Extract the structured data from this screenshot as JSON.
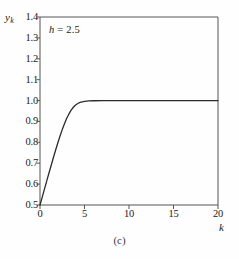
{
  "figure": {
    "caption": "(c)",
    "annotation_variable": "h",
    "annotation_text": "= 2.5",
    "background_color": "#fefefe",
    "line_color": "#2b2b2b",
    "axis_color": "#555555"
  },
  "chart_data": {
    "type": "line",
    "title": "",
    "subtitle": "",
    "xlabel": "k",
    "ylabel": "y",
    "ylabel_subscript": "k",
    "annotations": [
      {
        "text": "h = 2.5",
        "x": 1.0,
        "y": 1.33
      },
      {
        "text": "(c)",
        "position": "below-axis-center"
      }
    ],
    "xlim": [
      0,
      20
    ],
    "ylim": [
      0.5,
      1.4
    ],
    "xticks": [
      0,
      5,
      10,
      15,
      20
    ],
    "xtick_labels": [
      "0",
      "5",
      "10",
      "15",
      "20"
    ],
    "yticks": [
      0.5,
      0.6,
      0.7,
      0.8,
      0.9,
      1.0,
      1.1,
      1.2,
      1.3,
      1.4
    ],
    "ytick_labels": [
      "0.5",
      "0.6",
      "0.7",
      "0.8",
      "0.9",
      "1.0",
      "1.1",
      "1.2",
      "1.3",
      "1.4"
    ],
    "grid": false,
    "legend": null,
    "series": [
      {
        "name": "y_k",
        "parameter_h": 2.5,
        "x": [
          0,
          0.25,
          0.5,
          0.75,
          1,
          1.25,
          1.5,
          1.75,
          2,
          2.25,
          2.5,
          2.75,
          3,
          3.25,
          3.5,
          3.75,
          4,
          4.25,
          4.5,
          5,
          5.5,
          6,
          7,
          8,
          9,
          10,
          12,
          14,
          16,
          18,
          20
        ],
        "values": [
          0.5,
          0.538,
          0.576,
          0.614,
          0.652,
          0.689,
          0.726,
          0.762,
          0.797,
          0.83,
          0.861,
          0.889,
          0.915,
          0.936,
          0.954,
          0.968,
          0.979,
          0.986,
          0.991,
          0.996,
          0.998,
          0.999,
          1.0,
          1.0,
          1.0,
          1.0,
          1.0,
          1.0,
          1.0,
          1.0,
          1.0
        ]
      }
    ],
    "asymptote": 1.0,
    "start_point": {
      "x": 0,
      "y": 0.5
    }
  }
}
